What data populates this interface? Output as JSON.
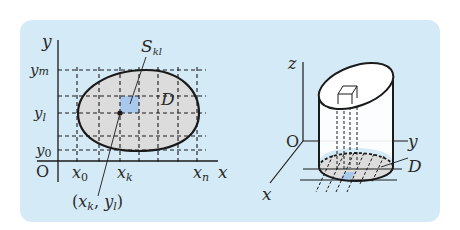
{
  "panel": {
    "background": "#d4eaf6"
  },
  "colors": {
    "region_fill": "#dcdcdc",
    "cell_fill": "#a9c9ec",
    "stroke": "#1a1a1a"
  },
  "left_diagram": {
    "axis_labels": {
      "x": "x",
      "y": "y",
      "origin": "O"
    },
    "y_ticks": [
      {
        "base": "y",
        "sub": "m"
      },
      {
        "base": "y",
        "sub": "l"
      },
      {
        "base": "y",
        "sub": "0"
      }
    ],
    "x_ticks": [
      {
        "base": "x",
        "sub": "0"
      },
      {
        "base": "x",
        "sub": "k"
      },
      {
        "base": "x",
        "sub": "n"
      }
    ],
    "region_label": "D",
    "cell_label": {
      "base": "S",
      "sub": "kl"
    },
    "point_label": {
      "open": "(",
      "x": "x",
      "xsub": "k",
      "sep": ", ",
      "y": "y",
      "ysub": "l",
      "close": ")"
    }
  },
  "right_diagram": {
    "axis_labels": {
      "x": "x",
      "y": "y",
      "z": "z",
      "origin": "O"
    },
    "region_label": "D"
  }
}
